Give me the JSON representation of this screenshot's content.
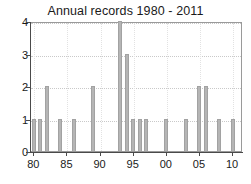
{
  "chart_data": {
    "type": "bar",
    "title": "Annual records 1980 - 2011",
    "xlabel": "",
    "ylabel": "",
    "ylim": [
      0,
      4
    ],
    "xlim": [
      1979.5,
      2011.5
    ],
    "grid": true,
    "legend": null,
    "y_ticks": [
      0,
      1,
      2,
      3,
      4
    ],
    "y_tick_labels": [
      "0",
      "1",
      "2",
      "3",
      "4"
    ],
    "x_ticks": [
      1980,
      1985,
      1990,
      1995,
      2000,
      2005,
      2010
    ],
    "x_tick_labels": [
      "80",
      "85",
      "90",
      "95",
      "00",
      "05",
      "10"
    ],
    "bar_color": "#b5b5b5",
    "bar_edge_color": "#a2a2a2",
    "axis_color": "#4a4a4a",
    "grid_color": "#c9c9c9",
    "background_color": "#ffffff",
    "categories": [
      1980,
      1981,
      1982,
      1983,
      1984,
      1985,
      1986,
      1987,
      1988,
      1989,
      1990,
      1991,
      1992,
      1993,
      1994,
      1995,
      1996,
      1997,
      1998,
      1999,
      2000,
      2001,
      2002,
      2003,
      2004,
      2005,
      2006,
      2007,
      2008,
      2009,
      2010,
      2011
    ],
    "values": [
      1,
      1,
      2,
      0,
      1,
      0,
      1,
      0,
      0,
      2,
      0,
      0,
      0,
      4,
      3,
      1,
      1,
      1,
      0,
      0,
      1,
      0,
      0,
      1,
      0,
      2,
      2,
      0,
      1,
      0,
      1,
      0
    ]
  },
  "title": {
    "text": "Annual records 1980 - 2011"
  }
}
